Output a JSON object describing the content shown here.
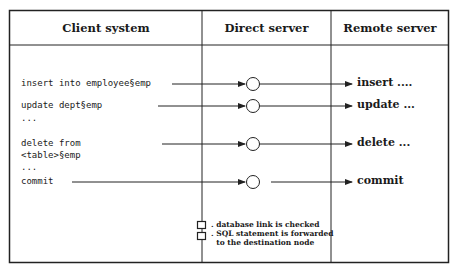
{
  "columns": [
    {
      "title": "Client system"
    },
    {
      "title": "Direct server"
    },
    {
      "title": "Remote server"
    }
  ],
  "client_statements": [
    {
      "text": "insert into employee§emp"
    },
    {
      "text": "update dept§emp"
    },
    {
      "text": "..."
    },
    {
      "text": "delete from"
    },
    {
      "text": "<table>§emp"
    },
    {
      "text": "..."
    },
    {
      "text": "commit"
    }
  ],
  "remote_actions": [
    {
      "text": "insert ...."
    },
    {
      "text": "update ..."
    },
    {
      "text": "delete ..."
    },
    {
      "text": "commit"
    }
  ],
  "legend": [
    {
      "text": ". database link is checked"
    },
    {
      "text": ". SQL statement is forwarded"
    },
    {
      "text": "  to the destination node"
    }
  ],
  "colors": {
    "line": "#222222",
    "background": "#ffffff"
  }
}
